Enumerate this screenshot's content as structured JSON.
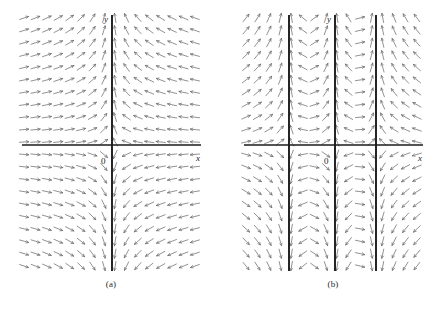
{
  "figure": {
    "background_color": "#ffffff",
    "arrow_color": "#6e6e6e",
    "axis_color": "#1a1a1a",
    "singularity_color": "#1a1a1a"
  },
  "panels": [
    {
      "id": "a",
      "caption": "(a)",
      "x_axis_label": "x",
      "y_axis_label": "y",
      "origin_label": "0"
    },
    {
      "id": "b",
      "caption": "(b)",
      "x_axis_label": "x",
      "y_axis_label": "y",
      "origin_label": "0"
    }
  ],
  "chart_data": {
    "type": "scatter",
    "title": "",
    "subtitle": "",
    "xlabel": "x",
    "ylabel": "y",
    "legend": [],
    "grid": false,
    "plots": [
      {
        "name": "(a)",
        "caption": "(a)",
        "description": "Direction field with a single vertical line of singularities at x = 0; slopes are horizontal far from the axis and steepen to vertical approaching x = 0.",
        "axes": {
          "x_axis": {
            "y_pixel": 145,
            "x_start": 22,
            "x_end": 201,
            "label": "x",
            "label_x": 196,
            "label_y": 153
          },
          "y_axis": {
            "x_pixel": 112,
            "y_start": 15,
            "y_end": 271,
            "label": "y",
            "label_x": 104,
            "label_y": 14
          },
          "origin": {
            "x_pixel": 112,
            "y_pixel": 145,
            "label": "0",
            "label_x": 101,
            "label_y": 156
          }
        },
        "singular_lines_x": [
          112
        ],
        "grid": {
          "x_min": 24,
          "x_max": 200,
          "y_min": 18,
          "y_max": 268,
          "dx": 11.4,
          "dy": 12.4
        },
        "slope_model": "k/(x - x0)",
        "slope_scale": 14,
        "xlim": [
          -8,
          8
        ],
        "ylim": [
          -10,
          10
        ]
      },
      {
        "name": "(b)",
        "caption": "(b)",
        "description": "Direction field with three vertical lines of singularities; slopes are horizontal in the outer regions and steepen to vertical near each singular line.",
        "axes": {
          "x_axis": {
            "y_pixel": 145,
            "x_start": 244,
            "x_end": 423,
            "label": "x",
            "label_x": 418,
            "label_y": 153
          },
          "y_axis": {
            "x_pixel": 335,
            "y_start": 15,
            "y_end": 271,
            "label": "y",
            "label_x": 327,
            "label_y": 14
          },
          "origin": {
            "x_pixel": 335,
            "y_pixel": 145,
            "label": "0",
            "label_x": 324,
            "label_y": 156
          }
        },
        "singular_lines_x": [
          289,
          335,
          376
        ],
        "grid": {
          "x_min": 246,
          "x_max": 422,
          "y_min": 18,
          "y_max": 268,
          "dx": 11.4,
          "dy": 12.4
        },
        "slope_model": "sum of k/(x - xi)",
        "slope_scale": 14,
        "xlim": [
          -8,
          8
        ],
        "ylim": [
          -10,
          10
        ]
      }
    ]
  }
}
